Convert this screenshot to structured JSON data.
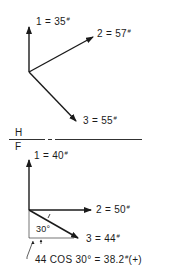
{
  "top_diagram": {
    "vectors": [
      {
        "label": "1 = 35",
        "unit": "#"
      },
      {
        "label": "2 = 57",
        "unit": "#"
      },
      {
        "label": "3 = 55",
        "unit": "#"
      }
    ]
  },
  "fold_line": {
    "top_label": "H",
    "bottom_label": "F"
  },
  "bottom_diagram": {
    "vectors": [
      {
        "label": "1 = 40",
        "unit": "#"
      },
      {
        "label": "2 = 50",
        "unit": "#"
      },
      {
        "label": "3 = 44",
        "unit": "#"
      }
    ],
    "angle_label": "30°",
    "component_note": {
      "prefix": "44 COS 30° = 38.2",
      "unit": "#",
      "suffix": "(+)"
    }
  },
  "colors": {
    "ink": "#1a1a1a",
    "background": "#ffffff"
  }
}
